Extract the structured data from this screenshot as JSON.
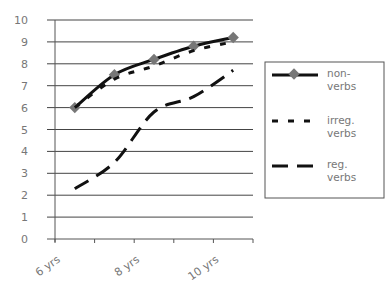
{
  "chart_data": {
    "type": "line",
    "title": "",
    "xlabel": "",
    "ylabel": "",
    "categories": [
      "6 yrs",
      "7 yrs",
      "8 yrs",
      "9 yrs",
      "10 yrs"
    ],
    "visible_x_tick_labels": [
      "6 yrs",
      "8 yrs",
      "10 yrs"
    ],
    "ylim": [
      0,
      10
    ],
    "yticks": [
      0,
      1,
      2,
      3,
      4,
      5,
      6,
      7,
      8,
      9,
      10
    ],
    "grid": "horizontal",
    "legend_position": "right",
    "series": [
      {
        "name": "non-verbs",
        "style": "solid",
        "marker": "diamond",
        "values": [
          6.0,
          7.5,
          8.2,
          8.8,
          9.2
        ]
      },
      {
        "name": "irreg. verbs",
        "style": "dotted",
        "marker": "none",
        "values": [
          6.0,
          7.3,
          7.9,
          8.6,
          9.0
        ]
      },
      {
        "name": "reg. verbs",
        "style": "dashed",
        "marker": "none",
        "values": [
          2.3,
          3.5,
          5.8,
          6.5,
          7.7
        ]
      }
    ]
  },
  "legend": {
    "items": [
      {
        "line1": "non-",
        "line2": "verbs"
      },
      {
        "line1": "irreg.",
        "line2": "verbs"
      },
      {
        "line1": "reg.",
        "line2": "verbs"
      }
    ]
  },
  "colors": {
    "line": "#111111",
    "marker": "#777777",
    "grid": "#444444",
    "text": "#777777"
  }
}
